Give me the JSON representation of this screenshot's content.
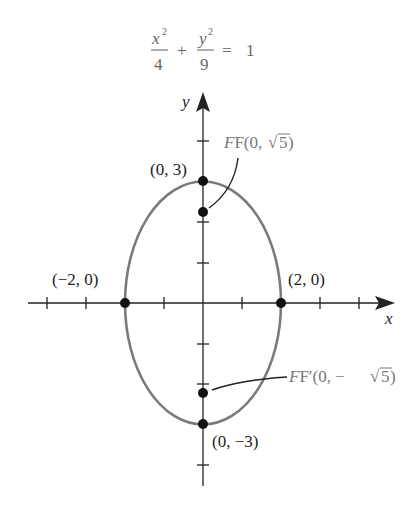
{
  "equation": {
    "term1_num": "x",
    "term1_exp": "2",
    "term1_den": "4",
    "plus": "+",
    "term2_num": "y",
    "term2_exp": "2",
    "term2_den": "9",
    "equals": "=",
    "rhs": "1"
  },
  "axes": {
    "x_label": "x",
    "y_label": "y"
  },
  "points": {
    "top_vertex": "(0, 3)",
    "bottom_vertex": "(0, −3)",
    "left_vertex": "(−2, 0)",
    "right_vertex": "(2, 0)",
    "focus_top_prefix": "F(0, ",
    "focus_top_radicand": "5",
    "focus_top_suffix": ")",
    "focus_bottom_prefix": "F′(0, −",
    "focus_bottom_radicand": "5",
    "focus_bottom_suffix": ")"
  },
  "colors": {
    "ellipse": "#7a7a7a",
    "axes": "#222222",
    "points": "#111111"
  }
}
